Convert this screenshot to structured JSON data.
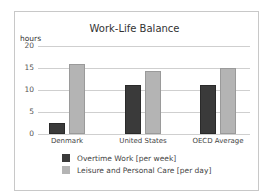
{
  "chart_data": {
    "type": "bar",
    "title": "Work-Life Balance",
    "xlabel": "",
    "ylabel": "hours",
    "ylim": [
      0,
      20
    ],
    "yticks": [
      0,
      5,
      10,
      15,
      20
    ],
    "grid": true,
    "legend_position": "bottom",
    "categories": [
      "Denmark",
      "United States",
      "OECD Average"
    ],
    "series": [
      {
        "name": "Overtime Work [per week]",
        "color": "#3a3a3a",
        "values": [
          2.4,
          11.1,
          11.1
        ]
      },
      {
        "name": "Leisure and Personal Care [per day]",
        "color": "#b4b4b4",
        "values": [
          15.9,
          14.3,
          15.0
        ]
      }
    ]
  }
}
